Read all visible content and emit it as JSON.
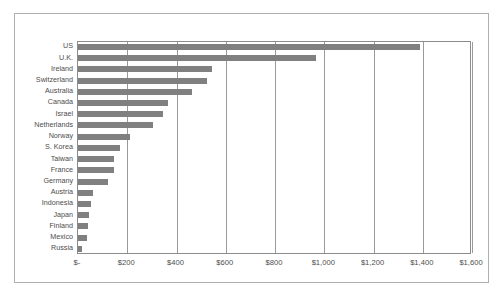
{
  "chart_data": {
    "type": "bar",
    "orientation": "horizontal",
    "title": "",
    "subtitle": "",
    "xlabel": "",
    "ylabel": "",
    "xlim": [
      0,
      1600
    ],
    "ylim": null,
    "grid": true,
    "legend": false,
    "legend_position": "none",
    "bar_color": "#808080",
    "categories": [
      "US",
      "U.K.",
      "Ireland",
      "Switzerland",
      "Australia",
      "Canada",
      "Israel",
      "Netherlands",
      "Norway",
      "S. Korea",
      "Taiwan",
      "France",
      "Germany",
      "Austria",
      "Indonesia",
      "Japan",
      "Finland",
      "Mexico",
      "Russia"
    ],
    "values": [
      1390,
      966,
      543,
      524,
      463,
      366,
      345,
      305,
      211,
      170,
      146,
      146,
      122,
      61,
      53,
      45,
      41,
      36,
      16
    ],
    "xticks": [
      0,
      200,
      400,
      600,
      800,
      1000,
      1200,
      1400,
      1600
    ],
    "xticklabels": [
      "$-",
      "$200",
      "$400",
      "$600",
      "$800",
      "$1,000",
      "$1,200",
      "$1,400",
      "$1,600"
    ]
  }
}
